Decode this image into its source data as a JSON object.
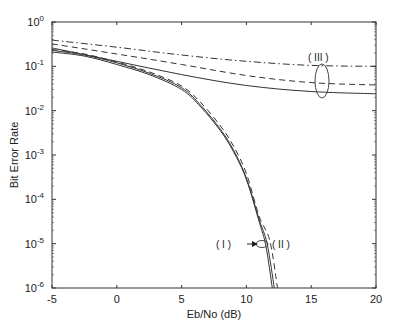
{
  "chart_data": {
    "type": "line",
    "title": "",
    "xlabel": "Eb/No (dB)",
    "ylabel": "Bit Error Rate",
    "xlim": [
      -5,
      20
    ],
    "ylim": [
      1e-06,
      1
    ],
    "yscale": "log",
    "grid": false,
    "legend": null,
    "x_ticks": [
      "-5",
      "0",
      "5",
      "10",
      "15",
      "20"
    ],
    "y_ticks": [
      "10^0",
      "10^-1",
      "10^-2",
      "10^-3",
      "10^-4",
      "10^-5",
      "10^-6"
    ],
    "series": [
      {
        "name": "(I) solid A",
        "group": "(I)",
        "style": "solid",
        "x": [
          -5,
          -2.5,
          0,
          2.5,
          5,
          6.5,
          8,
          9,
          10,
          11,
          11.5,
          12
        ],
        "y": [
          0.21,
          0.17,
          0.11,
          0.065,
          0.03,
          0.012,
          0.0035,
          0.0012,
          0.00028,
          3e-05,
          9e-06,
          1e-06
        ]
      },
      {
        "name": "(I) solid B",
        "group": "(I)",
        "style": "solid",
        "x": [
          -5,
          -2.5,
          0,
          2.5,
          5,
          6.5,
          8,
          9,
          10,
          11,
          11.6,
          12.15
        ],
        "y": [
          0.23,
          0.18,
          0.12,
          0.07,
          0.033,
          0.013,
          0.0038,
          0.0013,
          0.0003,
          3.4e-05,
          1e-05,
          1e-06
        ]
      },
      {
        "name": "(II) dashed",
        "group": "(II)",
        "style": "dashed",
        "x": [
          -5,
          -2.5,
          0,
          2.5,
          5,
          6.5,
          8,
          9,
          10,
          11,
          11.8,
          12.4
        ],
        "y": [
          0.24,
          0.19,
          0.125,
          0.075,
          0.036,
          0.015,
          0.0045,
          0.0016,
          0.00038,
          4e-05,
          1.2e-05,
          1e-06
        ]
      },
      {
        "name": "(III) solid",
        "group": "(III)",
        "style": "solid",
        "x": [
          -5,
          0,
          5,
          10,
          15,
          20
        ],
        "y": [
          0.26,
          0.13,
          0.065,
          0.037,
          0.027,
          0.024
        ]
      },
      {
        "name": "(III) dashed",
        "group": "(III)",
        "style": "dashed",
        "x": [
          -5,
          0,
          5,
          10,
          15,
          20
        ],
        "y": [
          0.32,
          0.19,
          0.11,
          0.062,
          0.043,
          0.038
        ]
      },
      {
        "name": "(III) dash-dot",
        "group": "(III)",
        "style": "dashdot",
        "x": [
          -5,
          0,
          5,
          10,
          15,
          20
        ],
        "y": [
          0.39,
          0.27,
          0.18,
          0.13,
          0.105,
          0.1
        ]
      }
    ],
    "annotations": [
      {
        "text": "( I )",
        "x": 8.3,
        "y": 1e-05,
        "arrow_to": [
          11.1,
          1e-05
        ]
      },
      {
        "text": "( II )",
        "x": 12.6,
        "y": 1e-05
      },
      {
        "text": "( III )",
        "x": 15.9,
        "y": 0.15,
        "ellipse_at": [
          15.9,
          0.045
        ]
      }
    ]
  },
  "labels": {
    "xlabel": "Eb/No (dB)",
    "ylabel": "Bit Error Rate",
    "ann_I": "( I )",
    "ann_II": "( II )",
    "ann_III": "( III )"
  }
}
